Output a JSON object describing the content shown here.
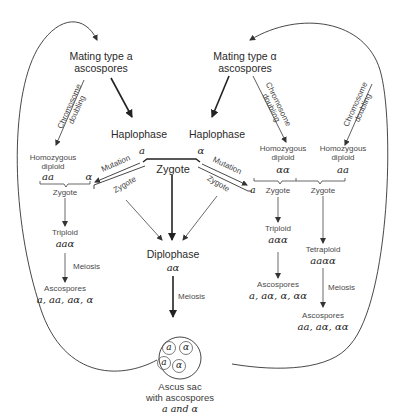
{
  "diagram": {
    "mating_a": {
      "line1": "Mating type a",
      "line2": "ascospores"
    },
    "mating_alpha": {
      "line1": "Mating type α",
      "line2": "ascospores"
    },
    "haplophase_left": {
      "label": "Haplophase",
      "type": "a"
    },
    "haplophase_right": {
      "label": "Haplophase",
      "type": "α"
    },
    "zygote_center": "Zygote",
    "chromosome_doubling": {
      "line1": "Chromosome",
      "line2": "doubling"
    },
    "mutation": "Mutation",
    "zygote": "Zygote",
    "meiosis": "Meiosis",
    "left_branch": {
      "diploid": {
        "line1": "Homozygous",
        "line2": "diploid",
        "genotype": "aa"
      },
      "mutant": "α",
      "zygote": "Zygote",
      "triploid": {
        "label": "Triploid",
        "genotype": "aaα"
      },
      "ascospores": {
        "label": "Ascospores",
        "genotypes": "a, aa, aα, α"
      }
    },
    "right_branch": {
      "mutant": "a",
      "diploid_alpha": {
        "line1": "Homozygous",
        "line2": "diploid",
        "genotype": "αα"
      },
      "diploid_a": {
        "line1": "Homozygous",
        "line2": "diploid",
        "genotype": "aa"
      },
      "zygote1": "Zygote",
      "zygote2": "Zygote",
      "triploid": {
        "label": "Triploid",
        "genotype": "aαα"
      },
      "tetraploid": {
        "label": "Tetraploid",
        "genotype": "aaαα"
      },
      "ascospores_triploid": {
        "label": "Ascospores",
        "genotypes": "a, aα, α, αα"
      },
      "ascospores_tetraploid": {
        "label": "Ascospores",
        "genotypes": "aa, aα, αα"
      }
    },
    "diplophase": {
      "label": "Diplophase",
      "genotype": "aα"
    },
    "ascus": {
      "spores": [
        "a",
        "α",
        "a",
        "α"
      ],
      "line1": "Ascus sac",
      "line2": "with ascospores",
      "line3": "a and α"
    }
  }
}
